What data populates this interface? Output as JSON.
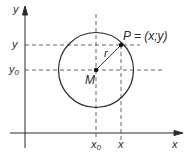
{
  "diagram": {
    "type": "circle-in-coordinate-plane",
    "colors": {
      "stroke": "#2a2a2a",
      "dash": "#555555",
      "background": "#ffffff"
    },
    "axes": {
      "x_label": "x",
      "y_label": "y"
    },
    "circle": {
      "center_label": "M",
      "radius_label": "r"
    },
    "point": {
      "label": "P = (x;y)"
    },
    "ticks": {
      "x0": {
        "base": "x",
        "sub": "0"
      },
      "x": "x",
      "y0": {
        "base": "y",
        "sub": "0"
      },
      "y": "y"
    }
  }
}
